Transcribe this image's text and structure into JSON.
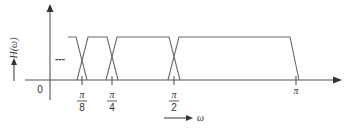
{
  "diagram": {
    "y_axis_label": "H(ω)",
    "x_axis_label": "ω",
    "origin_label": "0",
    "ellipsis": "---",
    "ticks": [
      {
        "num": "π",
        "den": "8",
        "value": "π/8"
      },
      {
        "num": "π",
        "den": "4",
        "value": "π/4"
      },
      {
        "num": "π",
        "den": "2",
        "value": "π/2"
      },
      {
        "num": "π",
        "den": "",
        "value": "π"
      }
    ],
    "bands": [
      {
        "name": "band-below-pi-8",
        "description": "passband ending near π/8"
      },
      {
        "name": "band-pi-8-to-pi-4",
        "description": "passband from π/8 to π/4"
      },
      {
        "name": "band-pi-4-to-pi-2",
        "description": "passband from π/4 to π/2"
      },
      {
        "name": "band-pi-2-to-pi",
        "description": "passband from π/2 to π"
      }
    ],
    "colors": {
      "line": "#6a6a6a",
      "axis": "#555555",
      "text": "#333333"
    }
  }
}
